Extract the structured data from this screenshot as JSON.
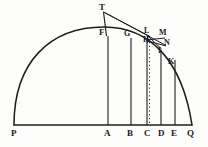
{
  "figure": {
    "ink_color": "#1d1d1d",
    "paper_color": "#fdfdfb",
    "width": 208,
    "height": 147
  },
  "baseline": {
    "name": "base-line-PQ",
    "y": 125,
    "x_start": 14,
    "x_end": 192
  },
  "arc": {
    "name": "circular-arc-PQ",
    "start": {
      "x": 14,
      "y": 125
    },
    "end": {
      "x": 192,
      "y": 125
    },
    "apex": {
      "x": 103,
      "y": 27
    }
  },
  "base_labels": [
    {
      "text": "P",
      "x": 11,
      "y": 130
    },
    {
      "text": "A",
      "x": 104,
      "y": 130
    },
    {
      "text": "B",
      "x": 127,
      "y": 130
    },
    {
      "text": "C",
      "x": 144,
      "y": 130
    },
    {
      "text": "D",
      "x": 158,
      "y": 130
    },
    {
      "text": "E",
      "x": 171,
      "y": 130
    },
    {
      "text": "Q",
      "x": 187,
      "y": 130
    }
  ],
  "upper_labels": [
    {
      "text": "T",
      "x": 99,
      "y": 6
    },
    {
      "text": "F",
      "x": 101,
      "y": 30
    },
    {
      "text": "G",
      "x": 124,
      "y": 32
    },
    {
      "text": "L",
      "x": 143,
      "y": 29
    },
    {
      "text": "H",
      "x": 143,
      "y": 38
    },
    {
      "text": "M",
      "x": 159,
      "y": 31
    },
    {
      "text": "N",
      "x": 164,
      "y": 41
    },
    {
      "text": "I",
      "x": 157,
      "y": 49
    },
    {
      "text": "K",
      "x": 168,
      "y": 60
    }
  ],
  "ordinates": [
    {
      "name": "ordinate-AF",
      "x": 108,
      "y_top": 36,
      "y_bottom": 125,
      "style": "solid"
    },
    {
      "name": "ordinate-BG",
      "x": 131,
      "y_top": 38,
      "y_bottom": 125,
      "style": "solid"
    },
    {
      "name": "ordinate-CH",
      "x": 147,
      "y_top": 41,
      "y_bottom": 125,
      "style": "solid"
    },
    {
      "name": "ordinate-DI",
      "x": 161,
      "y_top": 50,
      "y_bottom": 125,
      "style": "solid"
    },
    {
      "name": "ordinate-EK",
      "x": 175,
      "y_top": 60,
      "y_bottom": 125,
      "style": "solid"
    }
  ],
  "dotted_ordinate": {
    "name": "dotted-ordinate-CL",
    "x": 149,
    "y_top": 41,
    "y_bottom": 123,
    "style": "dotted"
  },
  "tangent_lines": [
    {
      "name": "tangent-line-TL",
      "x1": 103,
      "y1": 12,
      "x2": 150,
      "y2": 37
    },
    {
      "name": "tangent-line-TN",
      "x1": 103,
      "y1": 12,
      "x2": 166,
      "y2": 46
    },
    {
      "name": "line-TF",
      "x1": 103,
      "y1": 12,
      "x2": 106,
      "y2": 36
    },
    {
      "name": "line-HM",
      "x1": 147,
      "y1": 40,
      "x2": 164,
      "y2": 38
    },
    {
      "name": "line-HN",
      "x1": 147,
      "y1": 40,
      "x2": 165,
      "y2": 46
    },
    {
      "name": "line-LI",
      "x1": 148,
      "y1": 36,
      "x2": 161,
      "y2": 49
    }
  ]
}
